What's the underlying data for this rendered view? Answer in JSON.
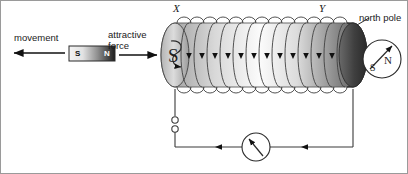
{
  "diagram": {
    "background_color": "#ffffff",
    "border_color": "#9a9a9a"
  },
  "labels": {
    "movement": "movement",
    "attractive_force_line1": "attractive",
    "attractive_force_line2": "force",
    "north_pole": "north pole",
    "terminal_x": "X",
    "terminal_y": "Y"
  },
  "bar_magnet": {
    "south_label": "S",
    "north_label": "N",
    "gradient_from": "#f2f2f2",
    "gradient_to": "#1e1e1e",
    "x": 68,
    "y": 45,
    "width": 46,
    "height": 14
  },
  "solenoid": {
    "near_face_pole": "S",
    "far_end_pole": "north pole",
    "coil_turns": 13,
    "x_left": 160,
    "x_right": 366,
    "y_top": 22,
    "y_bottom": 86,
    "body_light": "#fbfbfb",
    "body_mid": "#c8c8c8",
    "body_dark": "#4a4a4a",
    "cap_dark": "#3c3c3c"
  },
  "compass": {
    "north_label": "N",
    "south_label": "S",
    "center_x": 381,
    "center_y": 58,
    "radius": 19,
    "needle_angle_deg": -42
  },
  "circuit": {
    "meter_type": "galvanometer",
    "meter_center_x": 255,
    "meter_center_y": 146,
    "meter_radius": 14,
    "terminal_count": 2,
    "current_arrow_direction": "left",
    "current_arrow_count": 2,
    "wire_color": "#3a3a3a"
  },
  "arrows": {
    "movement_direction": "left",
    "attractive_force_direction": "right",
    "field_arrow_direction": "down",
    "field_arrow_count": 12
  },
  "colors": {
    "stroke": "#3a3a3a",
    "text": "#1a1a1a",
    "arrow_fill": "#111111"
  }
}
